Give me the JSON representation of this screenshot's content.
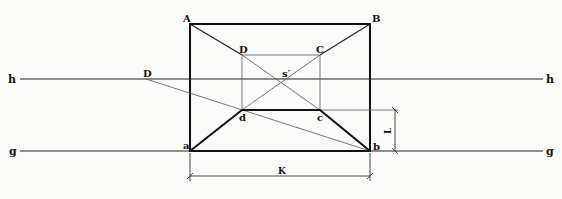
{
  "diagram": {
    "type": "perspective-construction",
    "lines": {
      "horizon": {
        "label_left": "h",
        "label_right": "h",
        "y": 79
      },
      "ground": {
        "label_left": "g",
        "label_right": "g",
        "y": 151
      }
    },
    "outer_rectangle": {
      "A": {
        "label": "A",
        "x": 190,
        "y": 24
      },
      "B": {
        "label": "B",
        "x": 370,
        "y": 24
      },
      "a": {
        "label": "a",
        "x": 190,
        "y": 151
      },
      "b": {
        "label": "b",
        "x": 370,
        "y": 151
      }
    },
    "inner_rectangle": {
      "D": {
        "label": "D",
        "x": 242,
        "y": 55
      },
      "C": {
        "label": "C",
        "x": 320,
        "y": 55
      },
      "d": {
        "label": "d",
        "x": 242,
        "y": 110
      },
      "c": {
        "label": "c",
        "x": 320,
        "y": 110
      }
    },
    "vanishing_point": {
      "label": "s′",
      "x": 281,
      "y": 79
    },
    "distance_point": {
      "label": "D",
      "x": 146,
      "y": 79
    },
    "dimensions": {
      "K": {
        "label": "K"
      },
      "L": {
        "label": "L"
      }
    }
  }
}
